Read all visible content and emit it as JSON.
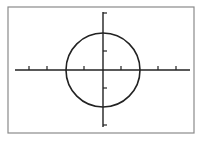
{
  "diagram": {
    "title": "",
    "frame": {
      "x": 8,
      "y": 7,
      "width": 186,
      "height": 126,
      "stroke": "#8a8a8a"
    },
    "axes": {
      "x_axis": {
        "y": 70,
        "x_start": 15,
        "x_end": 190,
        "ticks_x": [
          29,
          47,
          84,
          121,
          158,
          176
        ]
      },
      "y_axis": {
        "x": 103,
        "y_start": 12,
        "y_end": 127,
        "ticks_y": [
          13,
          51,
          88,
          125
        ]
      },
      "color": "#222222"
    },
    "circle": {
      "cx": 103,
      "cy": 70,
      "r": 37,
      "stroke": "#222222"
    }
  }
}
